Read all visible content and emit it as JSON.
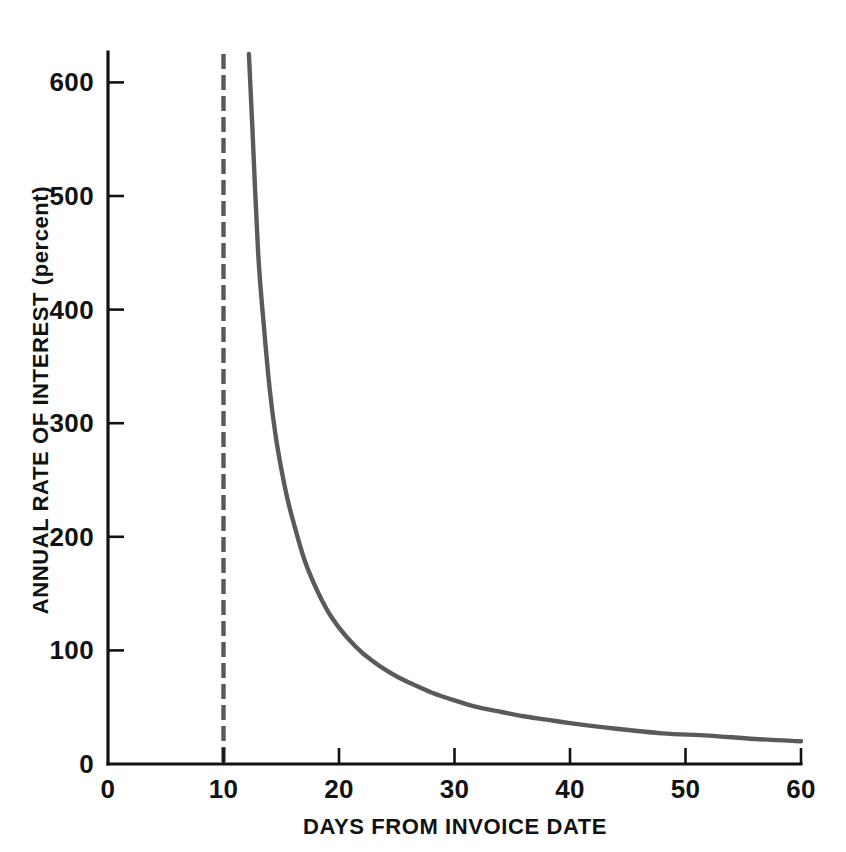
{
  "figure": {
    "background_color": "#ffffff",
    "axis_color": "#121212",
    "curve_color": "#5a5a5a",
    "marker_color": "#5a5a5a"
  },
  "chart_data": {
    "type": "line",
    "title": "",
    "xlabel": "DAYS FROM INVOICE DATE",
    "ylabel": "ANNUAL RATE OF INTEREST (percent)",
    "xlim": [
      0,
      60
    ],
    "ylim": [
      0,
      625
    ],
    "grid": false,
    "legend": "none",
    "xticks": [
      0,
      10,
      20,
      30,
      40,
      50,
      60
    ],
    "xticklabels": [
      "0",
      "10",
      "20",
      "30",
      "40",
      "50",
      "60"
    ],
    "yticks": [
      0,
      100,
      200,
      300,
      400,
      500,
      600
    ],
    "yticklabels": [
      "0",
      "100",
      "200",
      "300",
      "400",
      "500",
      "600"
    ],
    "series": [
      {
        "name": "Annual rate of interest",
        "style": "solid",
        "x": [
          12.2,
          12.5,
          13.0,
          13.5,
          14.0,
          14.5,
          15.0,
          15.5,
          16.0,
          17.0,
          18.0,
          19.0,
          20.0,
          21.0,
          22.0,
          23.0,
          24.0,
          25.0,
          26.0,
          28.0,
          30.0,
          32.0,
          34.0,
          36.0,
          38.0,
          40.0,
          44.0,
          48.0,
          52.0,
          56.0,
          60.0
        ],
        "y": [
          625,
          560,
          450,
          385,
          330,
          290,
          260,
          235,
          215,
          180,
          155,
          135,
          120,
          108,
          98,
          90,
          83,
          77,
          72,
          63,
          56,
          50,
          46,
          42,
          39,
          36,
          31,
          27,
          25,
          22,
          20
        ]
      },
      {
        "name": "Discount period (day 10)",
        "style": "dashed",
        "x": [
          10,
          10
        ],
        "y": [
          0,
          625
        ]
      }
    ],
    "annotations": []
  }
}
